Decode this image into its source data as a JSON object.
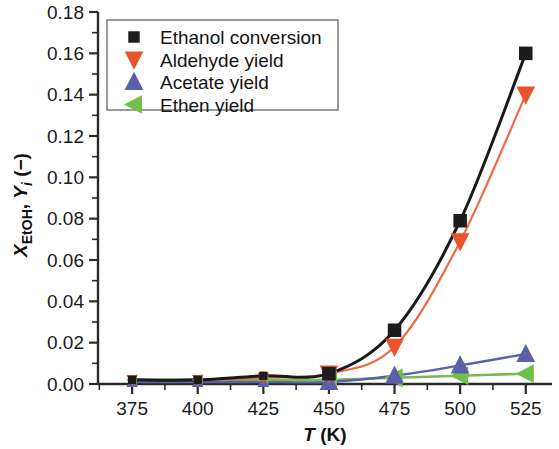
{
  "chart_data": {
    "type": "scatter",
    "title": "",
    "subtitle": "",
    "xlabel": "T (K)",
    "xlabel_italic_part": "T",
    "xlabel_rest": " (K)",
    "ylabel": "XEtOH, Yi (−)",
    "ylabel_parts": {
      "x_sym": "X",
      "x_sub": "EtOH",
      "sep": ", ",
      "y_sym": "Y",
      "y_sub": "i",
      "unit": " (−)"
    },
    "xlim": [
      362,
      535
    ],
    "ylim": [
      0.0,
      0.18
    ],
    "xticks": [
      375,
      400,
      425,
      450,
      475,
      500,
      525
    ],
    "xtick_labels": [
      "375",
      "400",
      "425",
      "450",
      "475",
      "500",
      "525"
    ],
    "yticks": [
      0.0,
      0.02,
      0.04,
      0.06,
      0.08,
      0.1,
      0.12,
      0.14,
      0.16,
      0.18
    ],
    "ytick_labels": [
      "0.00",
      "0.02",
      "0.04",
      "0.06",
      "0.08",
      "0.10",
      "0.12",
      "0.14",
      "0.16",
      "0.18"
    ],
    "x_minor_interval": 12.5,
    "y_minor_interval": 0.01,
    "grid": false,
    "legend_position": "top-left",
    "x": [
      375,
      400,
      425,
      450,
      475,
      500,
      525
    ],
    "series": [
      {
        "name": "Ethanol conversion",
        "marker": "square",
        "color": "#1c1c1c",
        "line_color": "#1a1a1a",
        "values": [
          0.002,
          0.002,
          0.004,
          0.005,
          0.026,
          0.079,
          0.16
        ]
      },
      {
        "name": "Aldehyde yield",
        "marker": "triangle-down",
        "color": "#e8552d",
        "line_color": "#ee6a44",
        "values": [
          0.002,
          0.002,
          0.003,
          0.005,
          0.018,
          0.069,
          0.14
        ]
      },
      {
        "name": "Acetate yield",
        "marker": "triangle-up",
        "color": "#5a5fa8",
        "line_color": "#5a5fa8",
        "values": [
          0.001,
          0.001,
          0.001,
          0.001,
          0.004,
          0.009,
          0.0145
        ]
      },
      {
        "name": "Ethen yield",
        "marker": "triangle-left",
        "color": "#6fbf4a",
        "line_color": "#6fbf4a",
        "values": [
          0.002,
          0.002,
          0.002,
          0.002,
          0.003,
          0.004,
          0.005
        ]
      }
    ]
  },
  "legend": {
    "items": [
      {
        "label": "Ethanol conversion",
        "marker": "square-marker",
        "color": "#1c1c1c"
      },
      {
        "label": "Aldehyde yield",
        "marker": "triangle-down-marker",
        "color": "#e8552d"
      },
      {
        "label": "Acetate yield",
        "marker": "triangle-up-marker",
        "color": "#5a5fa8"
      },
      {
        "label": "Ethen yield",
        "marker": "triangle-left-marker",
        "color": "#6fbf4a"
      }
    ]
  }
}
